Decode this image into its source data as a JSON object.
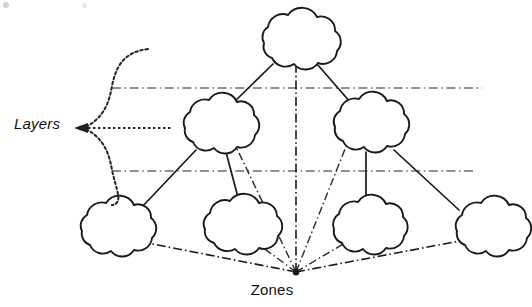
{
  "figure": {
    "type": "network-layer-zone-diagram",
    "background_color": "#ffffff",
    "stroke_color": "#1a1a1a",
    "layer_line_color": "#6d6d6d",
    "width": 532,
    "height": 307
  },
  "labels": {
    "layers": "Layers",
    "zones": "Zones"
  },
  "nodes": [
    {
      "id": "root",
      "name": "top-cloud",
      "tier": 0,
      "cx": 295,
      "cy": 41,
      "rx": 42,
      "ry": 31
    },
    {
      "id": "mid-l",
      "name": "middle-left-cloud",
      "tier": 1,
      "cx": 216,
      "cy": 125,
      "rx": 40,
      "ry": 30
    },
    {
      "id": "mid-r",
      "name": "middle-right-cloud",
      "tier": 1,
      "cx": 366,
      "cy": 124,
      "rx": 41,
      "ry": 30
    },
    {
      "id": "leaf-1",
      "name": "bottom-cloud-1",
      "tier": 2,
      "cx": 113,
      "cy": 228,
      "rx": 40,
      "ry": 30
    },
    {
      "id": "leaf-2",
      "name": "bottom-cloud-2",
      "tier": 2,
      "cx": 238,
      "cy": 226,
      "rx": 42,
      "ry": 30
    },
    {
      "id": "leaf-3",
      "name": "bottom-cloud-3",
      "tier": 2,
      "cx": 365,
      "cy": 227,
      "rx": 40,
      "ry": 29
    },
    {
      "id": "leaf-4",
      "name": "bottom-cloud-4",
      "tier": 2,
      "cx": 488,
      "cy": 228,
      "rx": 40,
      "ry": 30
    }
  ],
  "edges": [
    {
      "from": "root",
      "to": "mid-l",
      "style": "solid"
    },
    {
      "from": "root",
      "to": "mid-r",
      "style": "solid"
    },
    {
      "from": "mid-l",
      "to": "leaf-1",
      "style": "solid"
    },
    {
      "from": "mid-l",
      "to": "leaf-2",
      "style": "solid"
    },
    {
      "from": "mid-r",
      "to": "leaf-3",
      "style": "solid"
    },
    {
      "from": "mid-r",
      "to": "leaf-4",
      "style": "solid"
    }
  ],
  "layer_lines": [
    {
      "name": "layer-divider-upper",
      "y": 88,
      "x1": 112,
      "x2": 482,
      "style": "dash-dot"
    },
    {
      "name": "layer-divider-lower",
      "y": 171,
      "x1": 112,
      "x2": 474,
      "style": "dash-dot"
    }
  ],
  "zone_hub": {
    "x": 296,
    "y": 272
  },
  "zone_rays": [
    {
      "name": "zone-ray-to-bottom-cloud-1",
      "target_x": 122,
      "target_y": 238
    },
    {
      "name": "zone-ray-to-bottom-cloud-2",
      "target_x": 250,
      "target_y": 238
    },
    {
      "name": "zone-ray-to-bottom-cloud-3",
      "target_x": 355,
      "target_y": 237
    },
    {
      "name": "zone-ray-to-bottom-cloud-4",
      "target_x": 470,
      "target_y": 239
    },
    {
      "name": "zone-ray-to-middle-left-cloud",
      "target_x": 228,
      "target_y": 130
    },
    {
      "name": "zone-ray-to-middle-right-cloud",
      "target_x": 353,
      "target_y": 129
    },
    {
      "name": "zone-axis-to-top-cloud",
      "target_x": 296,
      "target_y": 35
    }
  ],
  "brace": {
    "name": "layers-brace",
    "style": "dashed-curly-brace",
    "tip_x": 76,
    "tip_y": 128,
    "top_y": 49,
    "bottom_y": 205,
    "spine_x": 108,
    "pointer_x2": 172
  }
}
